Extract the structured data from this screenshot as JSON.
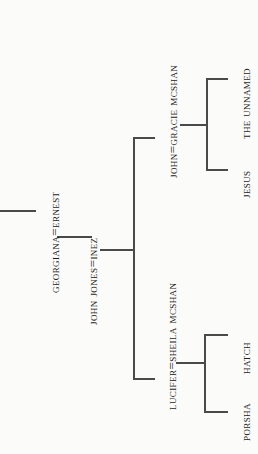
{
  "diagram": {
    "type": "family-tree",
    "orientation": "rotated-90-counterclockwise",
    "background_color": "#fbfbf9",
    "line_color": "#4a4a4a",
    "text_color": "#1b1b1b",
    "nodes": {
      "georgiana_ernest": "Georgiana=Ernest",
      "john_jones_inez": "John Jones=Inez",
      "john_gracie": "John=Gracie McShan",
      "lucifer_sheila": "Lucifer=Sheila McShan",
      "jesus": "Jesus",
      "the_unnamed": "The Unnamed",
      "porsha": "Porsha",
      "hatch": "Hatch"
    },
    "generations": [
      {
        "level": 1,
        "members": [
          "Georgiana=Ernest"
        ]
      },
      {
        "level": 2,
        "members": [
          "John Jones=Inez"
        ]
      },
      {
        "level": 3,
        "members": [
          "John=Gracie McShan",
          "Lucifer=Sheila McShan"
        ]
      },
      {
        "level": 4,
        "members": [
          "Jesus",
          "The Unnamed",
          "Porsha",
          "Hatch"
        ]
      }
    ],
    "relations": [
      {
        "parent": "Georgiana=Ernest",
        "child": "John Jones=Inez"
      },
      {
        "parent": "John Jones=Inez",
        "child": "John=Gracie McShan"
      },
      {
        "parent": "John Jones=Inez",
        "child": "Lucifer=Sheila McShan"
      },
      {
        "parent": "John=Gracie McShan",
        "child": "The Unnamed"
      },
      {
        "parent": "John=Gracie McShan",
        "child": "Jesus"
      },
      {
        "parent": "Lucifer=Sheila McShan",
        "child": "Hatch"
      },
      {
        "parent": "Lucifer=Sheila McShan",
        "child": "Porsha"
      }
    ]
  }
}
